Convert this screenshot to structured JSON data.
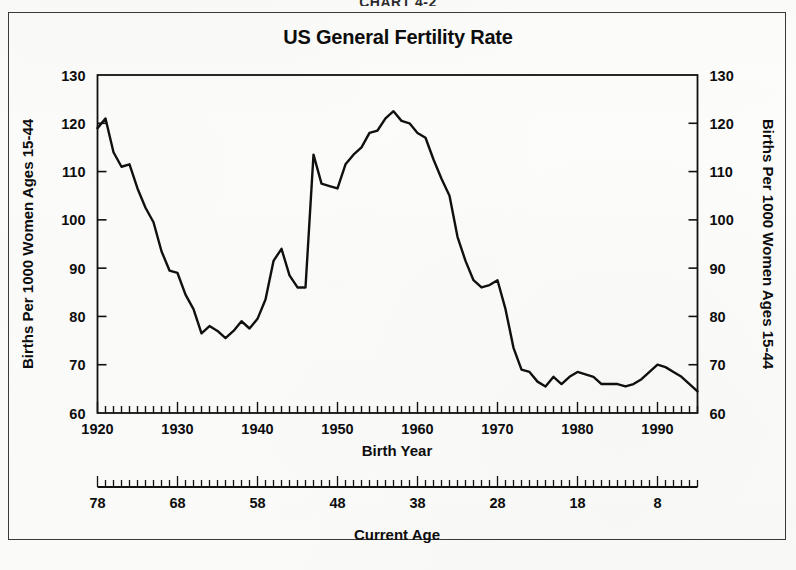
{
  "page": {
    "caption": "CHART 4-2"
  },
  "chart_data": {
    "type": "line",
    "title": "US General Fertility Rate",
    "xlabel": "Birth Year",
    "ylabel": "Births Per 1000 Women Ages 15-44",
    "ylabel_right": "Births Per 1000 Women Ages 15-44",
    "secondary_xlabel": "Current Age",
    "xlim": [
      1920,
      1995
    ],
    "ylim": [
      60,
      130
    ],
    "yticks": [
      60,
      70,
      80,
      90,
      100,
      110,
      120,
      130
    ],
    "ytick_labels": [
      "60",
      "70",
      "80",
      "90",
      "100",
      "110",
      "120",
      "130"
    ],
    "xticks": [
      1920,
      1930,
      1940,
      1950,
      1960,
      1970,
      1980,
      1990
    ],
    "xtick_labels": [
      "1920",
      "1930",
      "1940",
      "1950",
      "1960",
      "1970",
      "1980",
      "1990"
    ],
    "xtick_minor_step": 1,
    "secondary_xticks": [
      78,
      68,
      58,
      48,
      38,
      28,
      18,
      8
    ],
    "secondary_xtick_labels": [
      "78",
      "68",
      "58",
      "48",
      "38",
      "28",
      "18",
      "8"
    ],
    "grid": false,
    "legend": false,
    "line_color": "#101010",
    "series": [
      {
        "name": "US General Fertility Rate",
        "x": [
          1920,
          1921,
          1922,
          1923,
          1924,
          1925,
          1926,
          1927,
          1928,
          1929,
          1930,
          1931,
          1932,
          1933,
          1934,
          1935,
          1936,
          1937,
          1938,
          1939,
          1940,
          1941,
          1942,
          1943,
          1944,
          1945,
          1946,
          1947,
          1948,
          1949,
          1950,
          1951,
          1952,
          1953,
          1954,
          1955,
          1956,
          1957,
          1958,
          1959,
          1960,
          1961,
          1962,
          1963,
          1964,
          1965,
          1966,
          1967,
          1968,
          1969,
          1970,
          1971,
          1972,
          1973,
          1974,
          1975,
          1976,
          1977,
          1978,
          1979,
          1980,
          1981,
          1982,
          1983,
          1984,
          1985,
          1986,
          1987,
          1988,
          1989,
          1990,
          1991,
          1992,
          1993,
          1994,
          1995
        ],
        "values": [
          119.0,
          121.0,
          114.0,
          111.0,
          111.5,
          106.5,
          102.5,
          99.5,
          93.5,
          89.5,
          89.0,
          84.5,
          81.5,
          76.5,
          78.0,
          77.0,
          75.5,
          77.0,
          79.0,
          77.5,
          79.5,
          83.5,
          91.5,
          94.0,
          88.5,
          86.0,
          86.0,
          113.5,
          107.5,
          107.0,
          106.5,
          111.5,
          113.5,
          115.0,
          118.0,
          118.5,
          121.0,
          122.5,
          120.5,
          120.0,
          118.0,
          117.0,
          112.5,
          108.5,
          105.0,
          96.5,
          91.5,
          87.5,
          86.0,
          86.5,
          87.5,
          81.5,
          73.5,
          69.0,
          68.5,
          66.5,
          65.5,
          67.5,
          66.0,
          67.5,
          68.5,
          68.0,
          67.5,
          66.0,
          66.0,
          66.0,
          65.5,
          66.0,
          67.0,
          68.5,
          70.0,
          69.5,
          68.5,
          67.5,
          66.0,
          64.5
        ]
      }
    ]
  }
}
